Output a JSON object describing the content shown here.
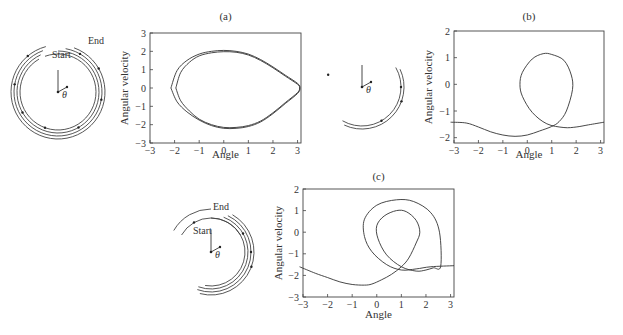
{
  "figure": {
    "panels": [
      {
        "id": "a",
        "label": "(a)"
      },
      {
        "id": "b",
        "label": "(b)"
      },
      {
        "id": "c",
        "label": "(c)"
      }
    ],
    "pendulum_diagrams": [
      {
        "panel": "a",
        "labels": {
          "start": "Start",
          "end": "End",
          "angle": "θ"
        }
      },
      {
        "panel": "b",
        "labels": {
          "angle": "θ"
        }
      },
      {
        "panel": "c",
        "labels": {
          "start": "Start",
          "end": "End",
          "angle": "θ"
        }
      }
    ]
  },
  "chart_data": [
    {
      "type": "line",
      "title": "(a)",
      "xlabel": "Angle",
      "ylabel": "Angular velocity",
      "xlim": [
        -3,
        3.14
      ],
      "ylim": [
        -3,
        3
      ],
      "xticks": [
        "-3",
        "-2",
        "-1",
        "0",
        "1",
        "2",
        "3"
      ],
      "yticks": [
        "-3",
        "-2",
        "-1",
        "0",
        "1",
        "2",
        "3"
      ],
      "grid": false,
      "series": [
        {
          "name": "outer orbit",
          "x": [
            -2.15,
            -1.9,
            -1.5,
            -1.0,
            -0.5,
            0.0,
            0.5,
            1.0,
            1.5,
            2.0,
            2.5,
            3.0,
            3.1,
            3.0,
            2.5,
            2.0,
            1.5,
            1.0,
            0.5,
            0.0,
            -0.5,
            -1.0,
            -1.5,
            -1.9,
            -2.15
          ],
          "y": [
            0,
            0.95,
            1.5,
            1.85,
            2.0,
            2.05,
            2.0,
            1.85,
            1.55,
            1.15,
            0.7,
            0.25,
            0,
            -0.3,
            -0.85,
            -1.4,
            -1.85,
            -2.1,
            -2.2,
            -2.2,
            -2.05,
            -1.75,
            -1.3,
            -0.75,
            0
          ]
        },
        {
          "name": "inner orbit",
          "x": [
            -1.95,
            -1.75,
            -1.4,
            -1.0,
            -0.5,
            0.0,
            0.5,
            1.0,
            1.5,
            2.0,
            2.5,
            3.0,
            3.08,
            3.0,
            2.5,
            2.0,
            1.5,
            1.0,
            0.5,
            0.0,
            -0.5,
            -1.0,
            -1.4,
            -1.75,
            -1.95
          ],
          "y": [
            0,
            0.85,
            1.4,
            1.75,
            1.92,
            1.98,
            1.95,
            1.8,
            1.5,
            1.1,
            0.65,
            0.2,
            0,
            -0.25,
            -0.8,
            -1.35,
            -1.8,
            -2.05,
            -2.15,
            -2.15,
            -2.0,
            -1.7,
            -1.25,
            -0.7,
            0
          ]
        }
      ]
    },
    {
      "type": "line",
      "title": "(b)",
      "xlabel": "Angle",
      "ylabel": "Angular velocity",
      "xlim": [
        -3,
        3.14
      ],
      "ylim": [
        -2.2,
        2
      ],
      "xticks": [
        "-3",
        "-2",
        "-1",
        "0",
        "1",
        "2",
        "3"
      ],
      "yticks": [
        "-2",
        "-1",
        "0",
        "1",
        "2"
      ],
      "grid": false,
      "series": [
        {
          "name": "trajectory",
          "x": [
            -3.14,
            -2.5,
            -2.0,
            -1.5,
            -1.0,
            -0.5,
            0.0,
            0.5,
            1.0,
            1.3,
            1.6,
            1.85,
            1.8,
            1.5,
            1.0,
            0.65,
            0.2,
            -0.2,
            -0.3,
            -0.2,
            0.2,
            0.8,
            1.5,
            2.0,
            2.5,
            3.14
          ],
          "y": [
            -1.42,
            -1.45,
            -1.6,
            -1.78,
            -1.9,
            -1.95,
            -1.9,
            -1.75,
            -1.58,
            -1.4,
            -1.0,
            -0.2,
            0.35,
            0.9,
            1.12,
            1.15,
            0.95,
            0.45,
            0.0,
            -0.45,
            -1.05,
            -1.48,
            -1.62,
            -1.6,
            -1.52,
            -1.42
          ]
        }
      ]
    },
    {
      "type": "line",
      "title": "(c)",
      "xlabel": "Angle",
      "ylabel": "Angular velocity",
      "xlim": [
        -3,
        3.14
      ],
      "ylim": [
        -3,
        2
      ],
      "xticks": [
        "-3",
        "-2",
        "-1",
        "0",
        "1",
        "2",
        "3"
      ],
      "yticks": [
        "-3",
        "-2",
        "-1",
        "0",
        "1",
        "2"
      ],
      "grid": false,
      "series": [
        {
          "name": "trajectory",
          "x": [
            -3.14,
            -2.5,
            -2.0,
            -1.5,
            -1.0,
            -0.5,
            -0.2,
            0.2,
            0.6,
            1.0,
            1.3,
            1.6,
            1.75,
            1.6,
            1.2,
            0.8,
            0.3,
            0.0,
            0.05,
            0.4,
            1.0,
            1.6,
            2.0,
            2.3,
            2.6,
            2.55,
            2.2,
            1.5,
            0.8,
            0.0,
            -0.5,
            -0.5,
            -0.2,
            0.4,
            1.0,
            1.6,
            2.2,
            3.14
          ],
          "y": [
            -1.6,
            -1.9,
            -2.1,
            -2.3,
            -2.42,
            -2.45,
            -2.4,
            -2.2,
            -1.95,
            -1.6,
            -1.2,
            -0.5,
            0.0,
            0.55,
            0.95,
            1.0,
            0.75,
            0.3,
            -0.3,
            -1.05,
            -1.6,
            -1.8,
            -1.75,
            -1.65,
            -1.58,
            0.0,
            0.9,
            1.42,
            1.5,
            1.25,
            0.6,
            -0.2,
            -0.9,
            -1.5,
            -1.75,
            -1.7,
            -1.6,
            -1.55
          ]
        }
      ]
    }
  ]
}
